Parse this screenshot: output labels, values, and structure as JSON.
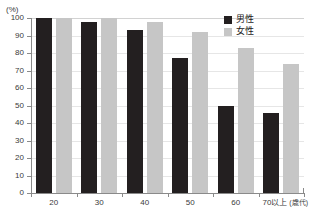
{
  "chart_data": {
    "type": "bar",
    "title": "",
    "subtitle": "",
    "xlabel": "(歳代)",
    "ylabel": "",
    "unit_label": "(%)",
    "categories": [
      "20",
      "30",
      "40",
      "50",
      "60",
      "70以上"
    ],
    "series": [
      {
        "name": "男性",
        "color": "#231f20",
        "values": [
          100,
          98,
          93,
          77,
          50,
          46
        ]
      },
      {
        "name": "女性",
        "color": "#c6c6c6",
        "values": [
          100,
          100,
          98,
          92,
          83,
          74
        ]
      }
    ],
    "ylim": [
      0,
      100
    ],
    "yticks": [
      "0",
      "10",
      "20",
      "30",
      "40",
      "50",
      "60",
      "70",
      "80",
      "90",
      "100"
    ],
    "grid": true,
    "legend_position": "top-right"
  },
  "legend": {
    "items": [
      {
        "label": "男性"
      },
      {
        "label": "女性"
      }
    ]
  },
  "axis": {
    "unit": "(%)",
    "x_suffix": "(歳代)"
  },
  "colors": {
    "male": "#231f20",
    "female": "#c6c6c6",
    "grid": "#e6e6e6",
    "axis": "#8a8a8a",
    "text": "#3a3a3a"
  }
}
